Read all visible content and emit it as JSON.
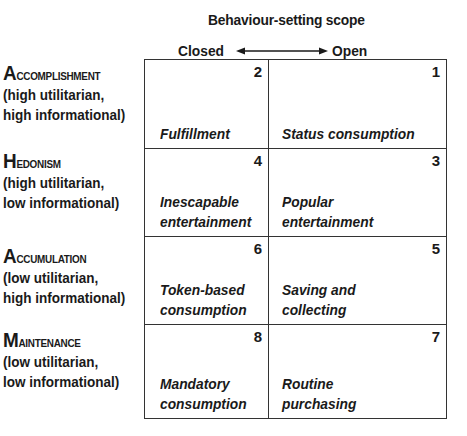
{
  "header": {
    "title": "Behaviour-setting scope",
    "axis_left": "Closed",
    "axis_right": "Open",
    "arrow_icon": "double-arrow-horizontal"
  },
  "rows": [
    {
      "title_initial": "A",
      "title_rest": "ccomplishment",
      "desc_line1": "(high utilitarian,",
      "desc_line2": "high informational)",
      "cells": [
        {
          "number": "2",
          "label": "Fulfillment"
        },
        {
          "number": "1",
          "label": "Status consumption"
        }
      ]
    },
    {
      "title_initial": "H",
      "title_rest": "edonism",
      "desc_line1": "(high utilitarian,",
      "desc_line2": "low informational)",
      "cells": [
        {
          "number": "4",
          "label": "Inescapable\nentertainment"
        },
        {
          "number": "3",
          "label": "Popular\nentertainment"
        }
      ]
    },
    {
      "title_initial": "A",
      "title_rest": "ccumulation",
      "desc_line1": "(low utilitarian,",
      "desc_line2": "high informational)",
      "cells": [
        {
          "number": "6",
          "label": "Token-based\nconsumption"
        },
        {
          "number": "5",
          "label": "Saving and\ncollecting"
        }
      ]
    },
    {
      "title_initial": "M",
      "title_rest": "aintenance",
      "desc_line1": "(low utilitarian,",
      "desc_line2": "low informational)",
      "cells": [
        {
          "number": "8",
          "label": "Mandatory\nconsumption"
        },
        {
          "number": "7",
          "label": "Routine\npurchasing"
        }
      ]
    }
  ]
}
